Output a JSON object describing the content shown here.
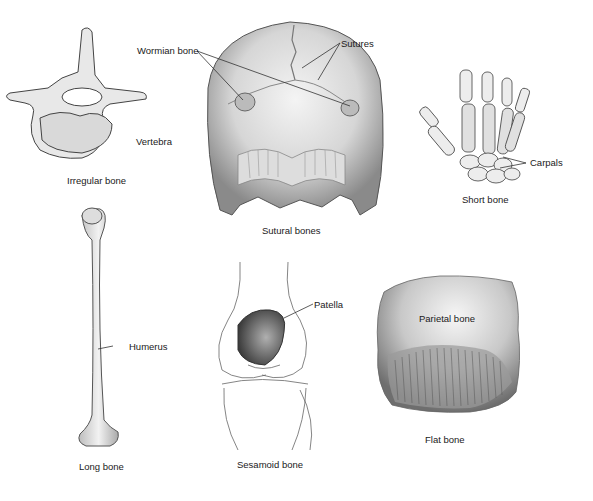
{
  "diagram": {
    "panels": [
      {
        "id": "irregular",
        "caption": "Irregular bone",
        "labels": [
          "Vertebra"
        ]
      },
      {
        "id": "sutural",
        "caption": "Sutural bones",
        "labels": [
          "Wormian bone",
          "Sutures"
        ]
      },
      {
        "id": "short",
        "caption": "Short bone",
        "labels": [
          "Carpals"
        ]
      },
      {
        "id": "long",
        "caption": "Long bone",
        "labels": [
          "Humerus"
        ]
      },
      {
        "id": "sesamoid",
        "caption": "Sesamoid bone",
        "labels": [
          "Patella"
        ]
      },
      {
        "id": "flat",
        "caption": "Flat bone",
        "labels": [
          "Parietal bone"
        ]
      }
    ]
  }
}
